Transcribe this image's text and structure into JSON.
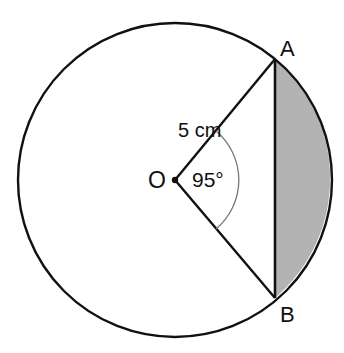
{
  "diagram": {
    "type": "circle-segment",
    "center": {
      "label": "O"
    },
    "points": [
      {
        "label": "A"
      },
      {
        "label": "B"
      }
    ],
    "radius_label": "5 cm",
    "angle_label": "95°",
    "shaded": "minor segment between chord AB and arc AB",
    "colors": {
      "stroke": "#111111",
      "shade": "#b3b3b3",
      "angle_arc": "#777777"
    }
  }
}
